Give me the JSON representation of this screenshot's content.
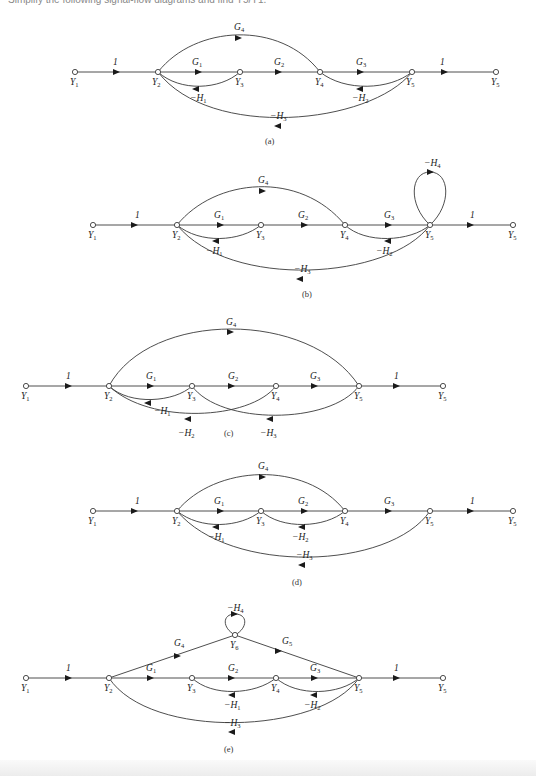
{
  "header": {
    "cut_text": "Simplify the following signal-flow diagrams and find Y5/Y1."
  },
  "diagrams": [
    {
      "id": "a",
      "caption": "(a)",
      "nodes": [
        "Y1",
        "Y2",
        "Y3",
        "Y4",
        "Y5",
        "Y5"
      ],
      "forward_gains": [
        "1",
        "G1",
        "G2",
        "G3",
        "1"
      ],
      "extra_forward": [
        {
          "label": "G4",
          "from": "Y2",
          "to": "Y4"
        }
      ],
      "feedback": [
        {
          "label": "-H1",
          "from": "Y3",
          "to": "Y2"
        },
        {
          "label": "-H2",
          "from": "Y5",
          "to": "Y4"
        },
        {
          "label": "-H3",
          "from": "Y5",
          "to": "Y2"
        }
      ]
    },
    {
      "id": "b",
      "caption": "(b)",
      "nodes": [
        "Y1",
        "Y2",
        "Y3",
        "Y4",
        "Y5",
        "Y5"
      ],
      "forward_gains": [
        "1",
        "G1",
        "G2",
        "G3",
        "1"
      ],
      "extra_forward": [
        {
          "label": "G4",
          "from": "Y2",
          "to": "Y4"
        }
      ],
      "feedback": [
        {
          "label": "-H1",
          "from": "Y3",
          "to": "Y2"
        },
        {
          "label": "-H2",
          "from": "Y5",
          "to": "Y4"
        },
        {
          "label": "-H3",
          "from": "Y5",
          "to": "Y2"
        }
      ],
      "self_loops": [
        {
          "label": "-H4",
          "node": "Y5"
        }
      ]
    },
    {
      "id": "c",
      "caption": "(c)",
      "nodes": [
        "Y1",
        "Y2",
        "Y3",
        "Y4",
        "Y5",
        "Y5"
      ],
      "forward_gains": [
        "1",
        "G1",
        "G2",
        "G3",
        "1"
      ],
      "extra_forward": [
        {
          "label": "G4",
          "from": "Y2",
          "to": "Y5"
        }
      ],
      "feedback": [
        {
          "label": "-H1",
          "from": "Y3",
          "to": "Y2"
        },
        {
          "label": "-H2",
          "from": "Y4",
          "to": "Y2"
        },
        {
          "label": "-H3",
          "from": "Y5",
          "to": "Y3"
        }
      ]
    },
    {
      "id": "d",
      "caption": "(d)",
      "nodes": [
        "Y1",
        "Y2",
        "Y3",
        "Y4",
        "Y5",
        "Y5"
      ],
      "forward_gains": [
        "1",
        "G1",
        "G2",
        "G3",
        "1"
      ],
      "extra_forward": [
        {
          "label": "G4",
          "from": "Y2",
          "to": "Y4"
        }
      ],
      "feedback": [
        {
          "label": "-H1",
          "from": "Y3",
          "to": "Y2"
        },
        {
          "label": "-H2",
          "from": "Y4",
          "to": "Y3"
        },
        {
          "label": "-H3",
          "from": "Y5",
          "to": "Y2"
        }
      ]
    },
    {
      "id": "e",
      "caption": "(e)",
      "nodes": [
        "Y1",
        "Y2",
        "Y3",
        "Y4",
        "Y5",
        "Y5",
        "Y6"
      ],
      "forward_gains": [
        "1",
        "G1",
        "G2",
        "G3",
        "1"
      ],
      "extra_forward": [
        {
          "label": "G4",
          "from": "Y2",
          "to": "Y6"
        },
        {
          "label": "G5",
          "from": "Y6",
          "to": "Y5"
        }
      ],
      "feedback": [
        {
          "label": "-H1",
          "from": "Y4",
          "to": "Y3"
        },
        {
          "label": "-H2",
          "from": "Y5",
          "to": "Y4"
        },
        {
          "label": "-H3",
          "from": "Y5",
          "to": "Y2"
        }
      ],
      "self_loops": [
        {
          "label": "-H4",
          "node": "Y6"
        }
      ]
    }
  ]
}
